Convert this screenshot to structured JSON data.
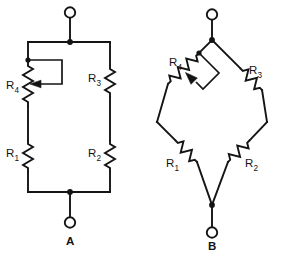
{
  "figure": {
    "background_color": "#ffffff",
    "ink_color": "#141414",
    "width": 308,
    "height": 254
  },
  "diagrams": [
    {
      "id": "diagram-a",
      "caption": "A",
      "style": "ladder",
      "terminals": [
        {
          "name": "top-terminal",
          "symbol": "open-circle"
        },
        {
          "name": "bottom-terminal",
          "symbol": "open-circle"
        }
      ],
      "components": [
        {
          "ref": "R4",
          "letter": "R",
          "subscript": "4",
          "type": "potentiometer",
          "orientation": "vertical",
          "branch": "left-upper"
        },
        {
          "ref": "R1",
          "letter": "R",
          "subscript": "1",
          "type": "resistor",
          "orientation": "vertical",
          "branch": "left-lower"
        },
        {
          "ref": "R3",
          "letter": "R",
          "subscript": "3",
          "type": "resistor",
          "orientation": "vertical",
          "branch": "right-upper"
        },
        {
          "ref": "R2",
          "letter": "R",
          "subscript": "2",
          "type": "resistor",
          "orientation": "vertical",
          "branch": "right-lower"
        }
      ]
    },
    {
      "id": "diagram-b",
      "caption": "B",
      "style": "bridge-diamond",
      "terminals": [
        {
          "name": "top-terminal",
          "symbol": "open-circle"
        },
        {
          "name": "bottom-terminal",
          "symbol": "open-circle"
        }
      ],
      "components": [
        {
          "ref": "R4",
          "letter": "R",
          "subscript": "4",
          "type": "potentiometer",
          "orientation": "diagonal",
          "branch": "upper-left"
        },
        {
          "ref": "R3",
          "letter": "R",
          "subscript": "3",
          "type": "resistor",
          "orientation": "diagonal",
          "branch": "upper-right"
        },
        {
          "ref": "R1",
          "letter": "R",
          "subscript": "1",
          "type": "resistor",
          "orientation": "diagonal",
          "branch": "lower-left"
        },
        {
          "ref": "R2",
          "letter": "R",
          "subscript": "2",
          "type": "resistor",
          "orientation": "diagonal",
          "branch": "lower-right"
        }
      ]
    }
  ],
  "labels": {
    "a": {
      "r4": {
        "letter": "R",
        "sub": "4"
      },
      "r1": {
        "letter": "R",
        "sub": "1"
      },
      "r3": {
        "letter": "R",
        "sub": "3"
      },
      "r2": {
        "letter": "R",
        "sub": "2"
      },
      "caption": "A"
    },
    "b": {
      "r4": {
        "letter": "R",
        "sub": "4"
      },
      "r3": {
        "letter": "R",
        "sub": "3"
      },
      "r1": {
        "letter": "R",
        "sub": "1"
      },
      "r2": {
        "letter": "R",
        "sub": "2"
      },
      "caption": "B"
    }
  }
}
